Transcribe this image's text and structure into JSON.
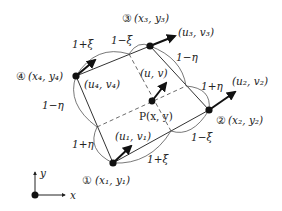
{
  "diagram": {
    "nodes": [
      {
        "id": "1",
        "circled": "①",
        "coord_label": "(x₁, y₁)",
        "disp_label": "(u₁, v₁)"
      },
      {
        "id": "2",
        "circled": "②",
        "coord_label": "(x₂, y₂)",
        "disp_label": "(u₂, v₂)"
      },
      {
        "id": "3",
        "circled": "③",
        "coord_label": "(x₃, y₃)",
        "disp_label": "(u₃, v₃)"
      },
      {
        "id": "4",
        "circled": "④",
        "coord_label": "(x₄, y₄)",
        "disp_label": "(u₄, v₄)"
      }
    ],
    "point": {
      "name": "P",
      "coord_label": "P(x, y)",
      "disp_label": "(u, v)"
    },
    "edge_segments": {
      "top_left": "1+ξ",
      "top_right": "1−ξ",
      "right_top": "1−η",
      "right_bottom": "1+η",
      "bottom_left": "1+ξ",
      "bottom_right": "1−ξ",
      "left_top": "1−η",
      "left_bottom": "1+η"
    },
    "axes": {
      "x_label": "x",
      "y_label": "y"
    },
    "colors": {
      "line": "#333333",
      "node": "#111111",
      "arrow": "#111111"
    }
  }
}
